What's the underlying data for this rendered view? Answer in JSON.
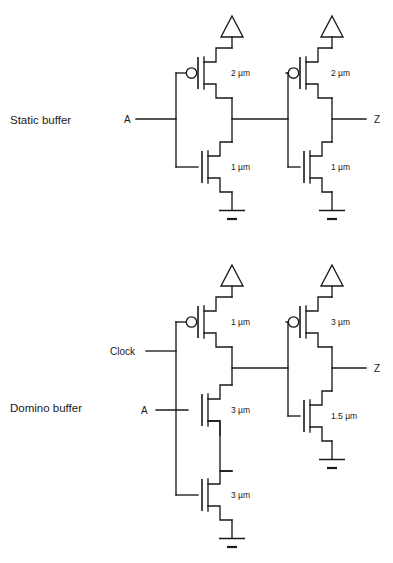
{
  "figure": {
    "title": "",
    "caption": "",
    "background_color": "#ffffff",
    "line_color": "#1a1a1a"
  },
  "circuits": [
    {
      "id": "static-buffer",
      "name": "Static buffer",
      "label": "Static buffer",
      "inputs": [
        {
          "name": "A",
          "label": "A"
        }
      ],
      "outputs": [
        {
          "name": "Z",
          "label": "Z"
        }
      ],
      "stages": [
        {
          "id": "stage-1",
          "transistors": [
            {
              "type": "pmos",
              "size_label": "2 µm",
              "width_um": 2,
              "gate": "A",
              "position": "pull-up"
            },
            {
              "type": "nmos",
              "size_label": "1 µm",
              "width_um": 1,
              "gate": "A",
              "position": "pull-down"
            }
          ],
          "supply": "VDD",
          "ground": "GND"
        },
        {
          "id": "stage-2",
          "transistors": [
            {
              "type": "pmos",
              "size_label": "2 µm",
              "width_um": 2,
              "gate": "stage-1-out",
              "position": "pull-up"
            },
            {
              "type": "nmos",
              "size_label": "1 µm",
              "width_um": 1,
              "gate": "stage-1-out",
              "position": "pull-down"
            }
          ],
          "supply": "VDD",
          "ground": "GND"
        }
      ]
    },
    {
      "id": "domino-buffer",
      "name": "Domino buffer",
      "label": "Domino buffer",
      "inputs": [
        {
          "name": "Clock",
          "label": "Clock"
        },
        {
          "name": "A",
          "label": "A"
        }
      ],
      "outputs": [
        {
          "name": "Z",
          "label": "Z"
        }
      ],
      "stages": [
        {
          "id": "stage-1",
          "transistors": [
            {
              "type": "pmos",
              "size_label": "1 µm",
              "width_um": 1,
              "gate": "Clock",
              "position": "pull-up"
            },
            {
              "type": "nmos",
              "size_label": "3 µm",
              "width_um": 3,
              "gate": "A",
              "position": "middle"
            },
            {
              "type": "nmos",
              "size_label": "3 µm",
              "width_um": 3,
              "gate": "Clock",
              "position": "foot"
            }
          ],
          "supply": "VDD",
          "ground": "GND"
        },
        {
          "id": "stage-2",
          "transistors": [
            {
              "type": "pmos",
              "size_label": "3 µm",
              "width_um": 3,
              "gate": "stage-1-out",
              "position": "pull-up"
            },
            {
              "type": "nmos",
              "size_label": "1.5 µm",
              "width_um": 1.5,
              "gate": "stage-1-out",
              "position": "pull-down"
            }
          ],
          "supply": "VDD",
          "ground": "GND"
        }
      ]
    }
  ],
  "labels": {
    "static_buffer": "Static buffer",
    "domino_buffer": "Domino buffer",
    "input_a_top": "A",
    "output_z_top": "Z",
    "input_clock": "Clock",
    "input_a_bottom": "A",
    "output_z_bottom": "Z",
    "size_sb_p1": "2 µm",
    "size_sb_n1": "1 µm",
    "size_sb_p2": "2 µm",
    "size_sb_n2": "1 µm",
    "size_db_p1": "1 µm",
    "size_db_n1": "3 µm",
    "size_db_n2": "3 µm",
    "size_db_p2": "3 µm",
    "size_db_n3": "1.5 µm"
  }
}
